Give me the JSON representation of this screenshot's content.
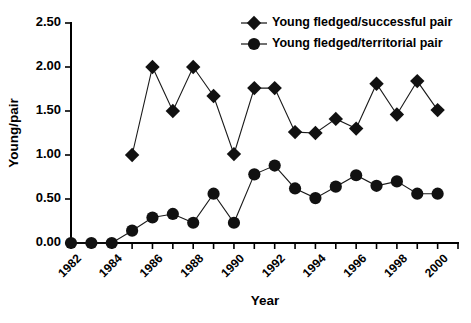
{
  "chart_data": {
    "type": "line",
    "title": "",
    "xlabel": "Year",
    "ylabel": "Young/pair",
    "xlim": [
      1982,
      2001
    ],
    "ylim": [
      0.0,
      2.5
    ],
    "yticks": [
      "0.00",
      "0.50",
      "1.00",
      "1.50",
      "2.00",
      "2.50"
    ],
    "ytick_values": [
      0.0,
      0.5,
      1.0,
      1.5,
      2.0,
      2.5
    ],
    "xticks_labeled": [
      "1982",
      "1984",
      "1986",
      "1988",
      "1990",
      "1992",
      "1994",
      "1996",
      "1998",
      "2000"
    ],
    "xtick_values_labeled": [
      1982,
      1984,
      1986,
      1988,
      1990,
      1992,
      1994,
      1996,
      1998,
      2000
    ],
    "xticks_all": [
      1982,
      1983,
      1984,
      1985,
      1986,
      1987,
      1988,
      1989,
      1990,
      1991,
      1992,
      1993,
      1994,
      1995,
      1996,
      1997,
      1998,
      1999,
      2000,
      2001
    ],
    "grid": false,
    "legend_position": "top-right",
    "x": [
      1982,
      1983,
      1984,
      1985,
      1986,
      1987,
      1988,
      1989,
      1990,
      1991,
      1992,
      1993,
      1994,
      1995,
      1996,
      1997,
      1998,
      1999,
      2000
    ],
    "series": [
      {
        "name": "Young fledged/successful pair",
        "marker": "diamond",
        "color": "#111111",
        "x": [
          1985,
          1986,
          1987,
          1988,
          1989,
          1990,
          1991,
          1992,
          1993,
          1994,
          1995,
          1996,
          1997,
          1998,
          1999,
          2000
        ],
        "values": [
          1.0,
          2.0,
          1.5,
          2.0,
          1.67,
          1.01,
          1.76,
          1.76,
          1.26,
          1.25,
          1.41,
          1.3,
          1.81,
          1.46,
          1.84,
          1.51
        ]
      },
      {
        "name": "Young fledged/territorial pair",
        "marker": "circle",
        "color": "#111111",
        "x": [
          1982,
          1983,
          1984,
          1985,
          1986,
          1987,
          1988,
          1989,
          1990,
          1991,
          1992,
          1993,
          1994,
          1995,
          1996,
          1997,
          1998,
          1999,
          2000
        ],
        "values": [
          0.0,
          0.0,
          0.0,
          0.14,
          0.29,
          0.33,
          0.23,
          0.56,
          0.23,
          0.78,
          0.88,
          0.62,
          0.51,
          0.64,
          0.77,
          0.65,
          0.7,
          0.56,
          0.56
        ]
      }
    ]
  },
  "legend": {
    "items": [
      {
        "label": "Young fledged/successful pair",
        "marker": "diamond"
      },
      {
        "label": "Young fledged/territorial pair",
        "marker": "circle"
      }
    ]
  }
}
